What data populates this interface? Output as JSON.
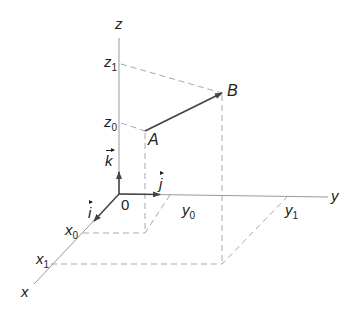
{
  "diagram": {
    "title": "",
    "colors": {
      "axis": "#9a9a9a",
      "dashed": "#a8a8a8",
      "vector": "#444444",
      "text": "#222222"
    },
    "axes": {
      "x": {
        "label": "x"
      },
      "y": {
        "label": "y"
      },
      "z": {
        "label": "z"
      },
      "origin": {
        "label": "0"
      }
    },
    "ticks": {
      "x0": {
        "base": "x",
        "sub": "0"
      },
      "x1": {
        "base": "x",
        "sub": "1"
      },
      "y0": {
        "base": "y",
        "sub": "0"
      },
      "y1": {
        "base": "y",
        "sub": "1"
      },
      "z0": {
        "base": "z",
        "sub": "0"
      },
      "z1": {
        "base": "z",
        "sub": "1"
      }
    },
    "points": {
      "A": {
        "label": "A"
      },
      "B": {
        "label": "B"
      }
    },
    "unit_vectors": {
      "i": {
        "label": "i"
      },
      "j": {
        "label": "j"
      },
      "k": {
        "label": "k"
      }
    }
  }
}
